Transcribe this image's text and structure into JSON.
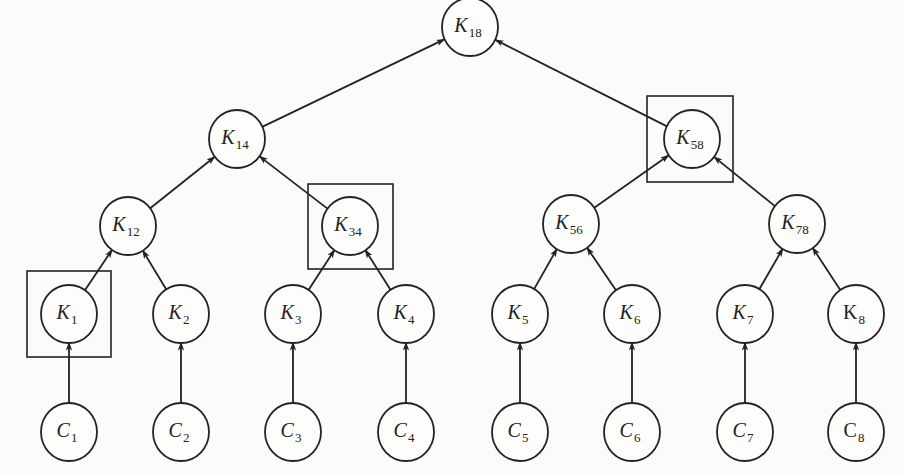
{
  "diagram": {
    "type": "key-tree",
    "direction": "child-to-parent",
    "nodes": [
      {
        "id": "K18",
        "letter": "K",
        "sub": "18",
        "x": 470,
        "y": 27,
        "italic": true
      },
      {
        "id": "K14",
        "letter": "K",
        "sub": "14",
        "x": 237,
        "y": 139,
        "italic": true
      },
      {
        "id": "K58",
        "letter": "K",
        "sub": "58",
        "x": 692,
        "y": 139,
        "italic": true,
        "boxed": true
      },
      {
        "id": "K12",
        "letter": "K",
        "sub": "12",
        "x": 128,
        "y": 226,
        "italic": true
      },
      {
        "id": "K34",
        "letter": "K",
        "sub": "34",
        "x": 350,
        "y": 226,
        "italic": true,
        "boxed": true
      },
      {
        "id": "K56",
        "letter": "K",
        "sub": "56",
        "x": 571,
        "y": 224,
        "italic": true
      },
      {
        "id": "K78",
        "letter": "K",
        "sub": "78",
        "x": 797,
        "y": 224,
        "italic": true
      },
      {
        "id": "K1",
        "letter": "K",
        "sub": "1",
        "x": 69,
        "y": 314,
        "italic": true,
        "boxed": true
      },
      {
        "id": "K2",
        "letter": "K",
        "sub": "2",
        "x": 181,
        "y": 314,
        "italic": true
      },
      {
        "id": "K3",
        "letter": "K",
        "sub": "3",
        "x": 293,
        "y": 314,
        "italic": true
      },
      {
        "id": "K4",
        "letter": "K",
        "sub": "4",
        "x": 406,
        "y": 314,
        "italic": true
      },
      {
        "id": "K5",
        "letter": "K",
        "sub": "5",
        "x": 520,
        "y": 314,
        "italic": true
      },
      {
        "id": "K6",
        "letter": "K",
        "sub": "6",
        "x": 632,
        "y": 314,
        "italic": true
      },
      {
        "id": "K7",
        "letter": "K",
        "sub": "7",
        "x": 745,
        "y": 314,
        "italic": true
      },
      {
        "id": "K8",
        "letter": "K",
        "sub": "8",
        "x": 856,
        "y": 314,
        "italic": false
      },
      {
        "id": "C1",
        "letter": "C",
        "sub": "1",
        "x": 69,
        "y": 432,
        "italic": true
      },
      {
        "id": "C2",
        "letter": "C",
        "sub": "2",
        "x": 181,
        "y": 432,
        "italic": true
      },
      {
        "id": "C3",
        "letter": "C",
        "sub": "3",
        "x": 293,
        "y": 432,
        "italic": true
      },
      {
        "id": "C4",
        "letter": "C",
        "sub": "4",
        "x": 406,
        "y": 432,
        "italic": true
      },
      {
        "id": "C5",
        "letter": "C",
        "sub": "5",
        "x": 520,
        "y": 432,
        "italic": true
      },
      {
        "id": "C6",
        "letter": "C",
        "sub": "6",
        "x": 632,
        "y": 432,
        "italic": true
      },
      {
        "id": "C7",
        "letter": "C",
        "sub": "7",
        "x": 745,
        "y": 432,
        "italic": true
      },
      {
        "id": "C8",
        "letter": "C",
        "sub": "8",
        "x": 856,
        "y": 432,
        "italic": false
      }
    ],
    "edges": [
      {
        "from": "K14",
        "to": "K18"
      },
      {
        "from": "K58",
        "to": "K18"
      },
      {
        "from": "K12",
        "to": "K14"
      },
      {
        "from": "K34",
        "to": "K14"
      },
      {
        "from": "K56",
        "to": "K58"
      },
      {
        "from": "K78",
        "to": "K58"
      },
      {
        "from": "K1",
        "to": "K12"
      },
      {
        "from": "K2",
        "to": "K12"
      },
      {
        "from": "K3",
        "to": "K34"
      },
      {
        "from": "K4",
        "to": "K34"
      },
      {
        "from": "K5",
        "to": "K56"
      },
      {
        "from": "K6",
        "to": "K56"
      },
      {
        "from": "K7",
        "to": "K78"
      },
      {
        "from": "K8",
        "to": "K78"
      },
      {
        "from": "C1",
        "to": "K1"
      },
      {
        "from": "C2",
        "to": "K2"
      },
      {
        "from": "C3",
        "to": "K3"
      },
      {
        "from": "C4",
        "to": "K4"
      },
      {
        "from": "C5",
        "to": "K5"
      },
      {
        "from": "C6",
        "to": "K6"
      },
      {
        "from": "C7",
        "to": "K7"
      },
      {
        "from": "C8",
        "to": "K8"
      }
    ],
    "boxes": [
      {
        "around": "K1",
        "x": 27,
        "y": 271,
        "w": 84,
        "h": 86
      },
      {
        "around": "K34",
        "x": 308,
        "y": 184,
        "w": 85,
        "h": 85
      },
      {
        "around": "K58",
        "x": 647,
        "y": 96,
        "w": 86,
        "h": 86
      }
    ],
    "node_radius": 28,
    "colors": {
      "stroke": "#222222",
      "background": "#fbfbf9"
    }
  }
}
